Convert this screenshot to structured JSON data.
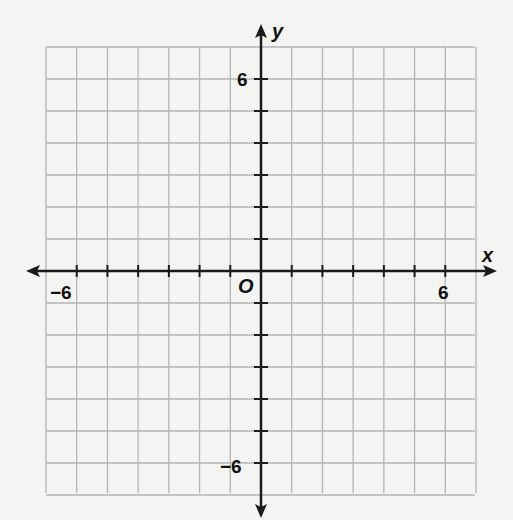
{
  "chart_data": {
    "type": "coordinate-grid",
    "title": "",
    "xlabel": "x",
    "ylabel": "y",
    "origin_label": "O",
    "xlim": [
      -7,
      7
    ],
    "ylim": [
      -7,
      7
    ],
    "grid": true,
    "grid_step": 1,
    "x_tick_labels": [
      {
        "value": -6,
        "label": "−6"
      },
      {
        "value": 6,
        "label": "6"
      }
    ],
    "y_tick_labels": [
      {
        "value": 6,
        "label": "6"
      },
      {
        "value": -6,
        "label": "−6"
      }
    ],
    "series": []
  },
  "colors": {
    "background": "#f4f4f2",
    "grid": "#b4b4b4",
    "axis": "#1a1a1a"
  }
}
